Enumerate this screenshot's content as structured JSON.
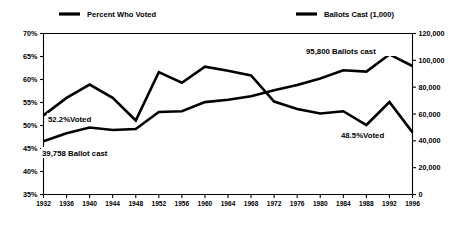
{
  "chart_data": {
    "type": "line",
    "title": "",
    "xlabel": "",
    "ylabel": "",
    "grid": false,
    "legend_position": "top",
    "categories": [
      "1932",
      "1936",
      "1940",
      "1944",
      "1948",
      "1952",
      "1956",
      "1960",
      "1964",
      "1968",
      "1972",
      "1976",
      "1980",
      "1984",
      "1988",
      "1992",
      "1996"
    ],
    "left_axis": {
      "label": "Percent Who Voted",
      "ylim": [
        35,
        70
      ],
      "ticks": [
        "35%",
        "40%",
        "45%",
        "50%",
        "55%",
        "60%",
        "65%",
        "70%"
      ],
      "tick_values": [
        35,
        40,
        45,
        50,
        55,
        60,
        65,
        70
      ]
    },
    "right_axis": {
      "label": "Ballots Cast (1,000)",
      "ylim": [
        0,
        120000
      ],
      "ticks": [
        "0",
        "20,000",
        "40,000",
        "60,000",
        "80,000",
        "100,000",
        "120,000"
      ],
      "tick_values": [
        0,
        20000,
        40000,
        60000,
        80000,
        100000,
        120000
      ]
    },
    "series": [
      {
        "name": "Percent Who Voted",
        "axis": "left",
        "values": [
          52.2,
          56.0,
          58.9,
          56.0,
          51.1,
          61.6,
          59.3,
          62.8,
          61.9,
          60.9,
          55.2,
          53.6,
          52.6,
          53.1,
          50.1,
          55.1,
          48.5
        ]
      },
      {
        "name": "Ballots Cast (1,000)",
        "axis": "right",
        "values": [
          39758,
          45648,
          49900,
          48026,
          48834,
          61551,
          62027,
          68838,
          70645,
          73212,
          77719,
          81556,
          86515,
          92653,
          91595,
          104405,
          95800
        ]
      }
    ],
    "annotations": [
      {
        "text": "52.2%Voted",
        "series": "Percent Who Voted",
        "x": 1932
      },
      {
        "text": "39,758 Ballot cast",
        "series": "Ballots Cast (1,000)",
        "x": 1932
      },
      {
        "text": "95,800 Ballots cast",
        "series": "Ballots Cast (1,000)",
        "x": 1996
      },
      {
        "text": "48.5%Voted",
        "series": "Percent Who Voted",
        "x": 1996
      }
    ]
  },
  "legend": {
    "items": [
      {
        "label": "Percent Who Voted",
        "color": "#000000"
      },
      {
        "label": "Ballots Cast (1,000)",
        "color": "#000000"
      }
    ]
  },
  "axes": {
    "left_ticks": [
      "70%",
      "65%",
      "60%",
      "55%",
      "50%",
      "45%",
      "40%",
      "35%"
    ],
    "right_ticks": [
      "120,000",
      "100,000",
      "80,000",
      "60,000",
      "40,000",
      "20,000",
      "0"
    ],
    "x_ticks": [
      "1932",
      "1936",
      "1940",
      "1944",
      "1948",
      "1952",
      "1956",
      "1960",
      "1964",
      "1968",
      "1972",
      "1976",
      "1980",
      "1984",
      "1988",
      "1992",
      "1996"
    ]
  },
  "annotations": {
    "left_percent": "52.2%Voted",
    "left_ballots": "39,758 Ballot cast",
    "right_ballots": "95,800 Ballots cast",
    "right_percent": "48.5%Voted"
  },
  "colors": {
    "line": "#000000",
    "background": "#ffffff",
    "axis": "#000000"
  }
}
